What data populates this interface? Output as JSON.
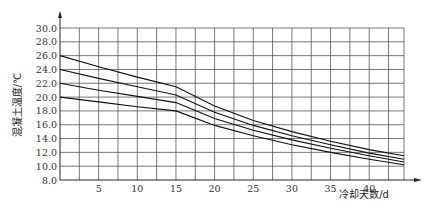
{
  "chart_data": {
    "type": "line",
    "title": "",
    "xlabel": "冷却天数/d",
    "ylabel": "混凝土温度/℃",
    "xlim": [
      0,
      44.5
    ],
    "ylim": [
      8.0,
      30.0
    ],
    "x_ticks": [
      5,
      10,
      15,
      20,
      25,
      30,
      35,
      40
    ],
    "x_tick_labels": [
      "5",
      "10",
      "15",
      "20",
      "25",
      "30",
      "35",
      "40"
    ],
    "y_ticks": [
      8,
      10,
      12,
      14,
      16,
      18,
      20,
      22,
      24,
      26,
      28,
      30
    ],
    "y_tick_labels": [
      "8.0",
      "10.0",
      "12.0",
      "14.0",
      "16.0",
      "18.0",
      "20.0",
      "22.0",
      "24.0",
      "26.0",
      "28.0",
      "30.0"
    ],
    "grid": true,
    "x_grid_step": 2.5,
    "legend": null,
    "series": [
      {
        "name": "curve-1",
        "x": [
          0,
          5,
          10,
          15,
          20,
          25,
          30,
          35,
          40,
          44.5
        ],
        "values": [
          26.0,
          24.4,
          22.9,
          21.5,
          18.7,
          16.6,
          15.0,
          13.6,
          12.4,
          11.5
        ]
      },
      {
        "name": "curve-2",
        "x": [
          0,
          5,
          10,
          15,
          20,
          25,
          30,
          35,
          40,
          44.5
        ],
        "values": [
          24.0,
          22.7,
          21.5,
          20.3,
          17.8,
          15.9,
          14.4,
          13.1,
          11.9,
          11.0
        ]
      },
      {
        "name": "curve-3",
        "x": [
          0,
          5,
          10,
          15,
          20,
          25,
          30,
          35,
          40,
          44.5
        ],
        "values": [
          22.0,
          21.0,
          20.1,
          19.2,
          16.9,
          15.2,
          13.8,
          12.6,
          11.5,
          10.6
        ]
      },
      {
        "name": "curve-4",
        "x": [
          0,
          5,
          10,
          15,
          20,
          25,
          30,
          35,
          40,
          44.5
        ],
        "values": [
          20.0,
          19.3,
          18.6,
          18.0,
          15.9,
          14.4,
          13.1,
          12.0,
          11.0,
          10.2
        ]
      }
    ]
  }
}
